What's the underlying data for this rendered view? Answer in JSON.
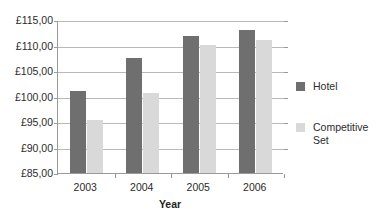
{
  "chart_data": {
    "type": "bar",
    "title": "",
    "subtitle": "",
    "xlabel": "Year",
    "ylabel": "",
    "categories": [
      "2003",
      "2004",
      "2005",
      "2006"
    ],
    "series": [
      {
        "name": "Hotel",
        "color": "#6f6f6f",
        "values": [
          101.1,
          107.6,
          111.8,
          113.0
        ]
      },
      {
        "name": "Competitive Set",
        "color": "#d9d9d9",
        "values": [
          95.4,
          100.7,
          110.1,
          111.0
        ]
      }
    ],
    "ylim": [
      85,
      115
    ],
    "ytick_step": 5,
    "ytick_values": [
      85,
      90,
      95,
      100,
      105,
      110,
      115
    ],
    "ytick_labels": [
      "£85,00",
      "£90,00",
      "£95,00",
      "£100,00",
      "£105,00",
      "£110,00",
      "£115,00"
    ],
    "currency_symbol": "£",
    "decimal_separator": ",",
    "grid": true,
    "grid_axis": "y",
    "legend_position": "right",
    "legend_entries": [
      "Hotel",
      "Competitive Set"
    ],
    "background": "#ffffff",
    "axis_color": "#9a9a9a",
    "gridline_color": "#b9b9b9"
  }
}
